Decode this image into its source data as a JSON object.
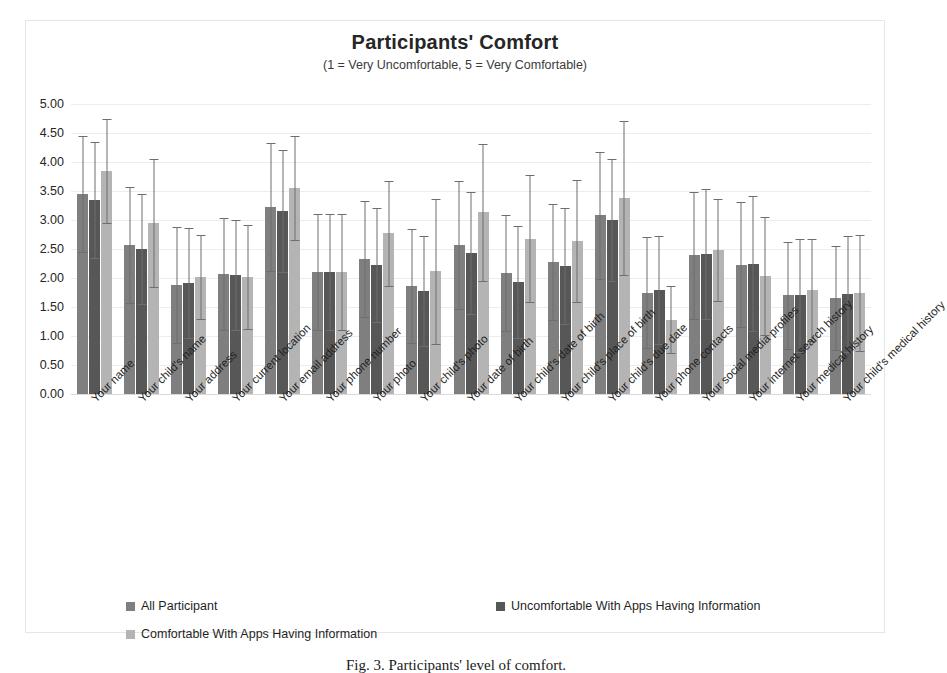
{
  "chart_data": {
    "type": "bar",
    "title": "Participants' Comfort",
    "subtitle": "(1 = Very Uncomfortable, 5 = Very Comfortable)",
    "xlabel": "",
    "ylabel": "",
    "ylim": [
      0,
      5
    ],
    "ytick_step": 0.5,
    "yticks": [
      "0.00",
      "0.50",
      "1.00",
      "1.50",
      "2.00",
      "2.50",
      "3.00",
      "3.50",
      "4.00",
      "4.50",
      "5.00"
    ],
    "grid": true,
    "legend_position": "bottom",
    "error_bars": true,
    "categories": [
      "Your name",
      "Your child's name",
      "Your address",
      "Your current location",
      "Your email address",
      "Your phone number",
      "Your photo",
      "Your child's photo",
      "Your date of birth",
      "Your child's date of birth",
      "Your child's place of birth",
      "Your child's due date",
      "Your phone contacts",
      "Your social media profiles",
      "Your internet search history",
      "Your medical history",
      "Your child's medical history"
    ],
    "series": [
      {
        "name": "All Participant",
        "color": "#7f7f7f",
        "values": [
          3.45,
          2.57,
          1.88,
          2.07,
          3.22,
          2.1,
          2.32,
          1.86,
          2.57,
          2.08,
          2.28,
          3.08,
          1.75,
          2.39,
          2.23,
          1.7,
          1.66
        ],
        "err_low": [
          1.0,
          1.0,
          1.0,
          0.97,
          1.1,
          1.0,
          1.0,
          0.98,
          1.1,
          1.0,
          1.0,
          1.1,
          0.95,
          1.1,
          1.08,
          0.92,
          0.9
        ],
        "err_high": [
          1.0,
          1.0,
          1.0,
          0.97,
          1.1,
          1.0,
          1.0,
          0.98,
          1.1,
          1.0,
          1.0,
          1.1,
          0.95,
          1.1,
          1.08,
          0.92,
          0.9
        ]
      },
      {
        "name": "Uncomfortable With Apps Having Information",
        "color": "#575757",
        "values": [
          3.35,
          2.5,
          1.92,
          2.05,
          3.15,
          2.1,
          2.22,
          1.78,
          2.43,
          1.93,
          2.21,
          3.0,
          1.8,
          2.42,
          2.25,
          1.7,
          1.73
        ],
        "err_low": [
          1.0,
          0.95,
          0.95,
          0.95,
          1.05,
          1.0,
          0.98,
          0.95,
          1.05,
          0.97,
          1.0,
          1.05,
          0.93,
          1.12,
          1.17,
          0.97,
          1.0
        ],
        "err_high": [
          1.0,
          0.95,
          0.95,
          0.95,
          1.05,
          1.0,
          0.98,
          0.95,
          1.05,
          0.97,
          1.0,
          1.05,
          0.93,
          1.12,
          1.17,
          0.97,
          1.0
        ]
      },
      {
        "name": "Comfortable With Apps Having Information",
        "color": "#b4b4b4",
        "values": [
          3.85,
          2.95,
          2.02,
          2.02,
          3.55,
          2.1,
          2.77,
          2.12,
          3.13,
          2.68,
          2.64,
          3.38,
          1.28,
          2.48,
          2.03,
          1.8,
          1.75
        ],
        "err_low": [
          0.9,
          1.1,
          0.72,
          0.9,
          0.9,
          1.0,
          0.9,
          1.25,
          1.18,
          1.1,
          1.05,
          1.32,
          0.58,
          0.88,
          1.02,
          0.88,
          1.0
        ],
        "err_high": [
          0.9,
          1.1,
          0.72,
          0.9,
          0.9,
          1.0,
          0.9,
          1.25,
          1.18,
          1.1,
          1.05,
          1.32,
          0.58,
          0.88,
          1.02,
          0.88,
          1.0
        ]
      }
    ]
  },
  "caption": "Fig. 3.  Participants' level of comfort."
}
